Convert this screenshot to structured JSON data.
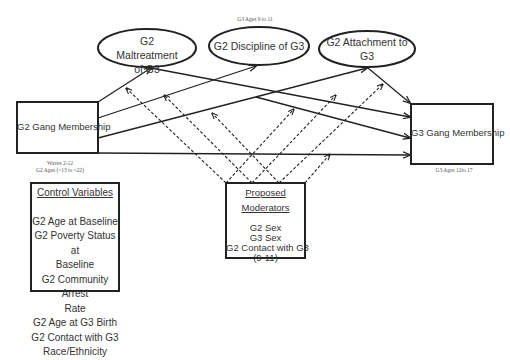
{
  "notes": {
    "g3_ages_top": "G3 Ages 9 to 11",
    "waves": "Waves 2-12",
    "g2_ages": "G2 Ages (~13 to ~22)",
    "g3_ages_bottom": "G3 Ages 12to 17"
  },
  "nodes": {
    "g2_gang": "G2 Gang Membership",
    "g3_gang": "G3 Gang Membership",
    "maltreatment": {
      "line1": "G2 Maltreatment",
      "line2": "of G3"
    },
    "discipline": {
      "line1": "G2 Discipline of G3"
    },
    "attachment": {
      "line1": "G2 Attachment to",
      "line2": "G3"
    }
  },
  "control_variables": {
    "heading": "Control Variables",
    "items": [
      "G2 Age at Baseline",
      "G2 Poverty Status at",
      "Baseline",
      "G2 Community Arrest",
      "Rate",
      "G2 Age at G3 Birth",
      "G2 Contact with G3",
      "Race/Ethnicity"
    ]
  },
  "moderators": {
    "heading_line1": "Proposed",
    "heading_line2": "Moderators",
    "items": [
      "G2 Sex",
      "G3 Sex",
      "G2 Contact with G3",
      "(9-11)"
    ]
  },
  "edges": {
    "solid": [
      {
        "from": "G2 Gang Membership",
        "to": "G2 Maltreatment of G3"
      },
      {
        "from": "G2 Gang Membership",
        "to": "G2 Discipline of G3"
      },
      {
        "from": "G2 Gang Membership",
        "to": "G2 Attachment to G3"
      },
      {
        "from": "G2 Gang Membership",
        "to": "G3 Gang Membership"
      },
      {
        "from": "G2 Maltreatment of G3",
        "to": "G3 Gang Membership"
      },
      {
        "from": "G2 Discipline of G3",
        "to": "G3 Gang Membership"
      },
      {
        "from": "G2 Attachment to G3",
        "to": "G3 Gang Membership"
      }
    ],
    "dashed": [
      {
        "from": "Proposed Moderators",
        "to": "path G2 Gang -> Maltreatment"
      },
      {
        "from": "Proposed Moderators",
        "to": "path G2 Gang -> Discipline"
      },
      {
        "from": "Proposed Moderators",
        "to": "path G2 Gang -> Attachment"
      },
      {
        "from": "Proposed Moderators",
        "to": "path Maltreatment -> G3 Gang"
      },
      {
        "from": "Proposed Moderators",
        "to": "path Discipline -> G3 Gang"
      },
      {
        "from": "Proposed Moderators",
        "to": "path Attachment -> G3 Gang"
      },
      {
        "from": "Proposed Moderators",
        "to": "path G2 Gang -> G3 Gang"
      }
    ]
  },
  "colors": {
    "stroke": "#222222",
    "text": "#333333",
    "background": "#ffffff"
  }
}
